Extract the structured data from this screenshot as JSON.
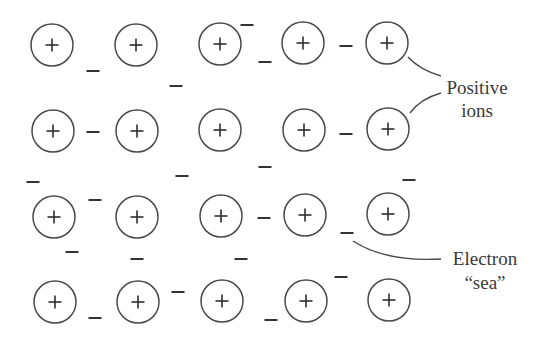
{
  "figure": {
    "type": "metallic-bonding-diagram",
    "colors": {
      "stroke": "#4a4a4a",
      "text": "#3a3a3a",
      "background": "#ffffff"
    },
    "ion_symbol": "+",
    "electron_symbol": "−",
    "ion_radius": 21,
    "ions": [
      {
        "x": 52,
        "y": 45
      },
      {
        "x": 136,
        "y": 45
      },
      {
        "x": 220,
        "y": 44
      },
      {
        "x": 303,
        "y": 43
      },
      {
        "x": 387,
        "y": 43
      },
      {
        "x": 53,
        "y": 131
      },
      {
        "x": 137,
        "y": 131
      },
      {
        "x": 220,
        "y": 130
      },
      {
        "x": 304,
        "y": 130
      },
      {
        "x": 388,
        "y": 129
      },
      {
        "x": 54,
        "y": 217
      },
      {
        "x": 137,
        "y": 217
      },
      {
        "x": 221,
        "y": 216
      },
      {
        "x": 305,
        "y": 215
      },
      {
        "x": 388,
        "y": 214
      },
      {
        "x": 55,
        "y": 302
      },
      {
        "x": 138,
        "y": 302
      },
      {
        "x": 222,
        "y": 301
      },
      {
        "x": 306,
        "y": 301
      },
      {
        "x": 389,
        "y": 300
      }
    ],
    "electrons": [
      {
        "x": 93,
        "y": 71
      },
      {
        "x": 176,
        "y": 86
      },
      {
        "x": 247,
        "y": 25
      },
      {
        "x": 265,
        "y": 62
      },
      {
        "x": 346,
        "y": 46
      },
      {
        "x": 93,
        "y": 132
      },
      {
        "x": 33,
        "y": 182
      },
      {
        "x": 182,
        "y": 176
      },
      {
        "x": 265,
        "y": 167
      },
      {
        "x": 346,
        "y": 134
      },
      {
        "x": 409,
        "y": 180
      },
      {
        "x": 95,
        "y": 200
      },
      {
        "x": 72,
        "y": 252
      },
      {
        "x": 137,
        "y": 259
      },
      {
        "x": 241,
        "y": 259
      },
      {
        "x": 264,
        "y": 218
      },
      {
        "x": 347,
        "y": 233
      },
      {
        "x": 95,
        "y": 318
      },
      {
        "x": 178,
        "y": 292
      },
      {
        "x": 271,
        "y": 320
      },
      {
        "x": 341,
        "y": 277
      }
    ],
    "labels": {
      "positive_ions": {
        "line1": "Positive",
        "line2": "ions"
      },
      "electron_sea": {
        "line1": "Electron",
        "line2": "“sea”"
      }
    }
  }
}
